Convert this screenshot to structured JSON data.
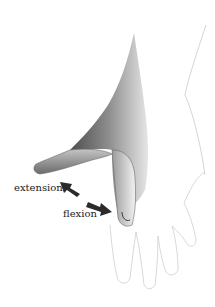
{
  "figure": {
    "labels": {
      "extension": "extension",
      "flexion": "flexion"
    },
    "colors": {
      "background": "#ffffff",
      "arrow": "#2b2b2b",
      "shading_dark": "#5a5a5a",
      "shading_light": "#bdbdbd",
      "outline": "#c8c8c8"
    }
  }
}
